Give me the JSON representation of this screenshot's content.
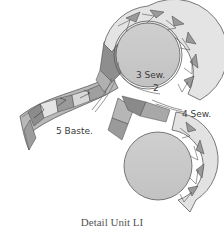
{
  "diagram": {
    "caption": "Detail Unit LI",
    "labels": {
      "step3": "3 Sew.",
      "step2": "2",
      "step4": "4 Sew.",
      "step5": "5 Baste."
    },
    "colors": {
      "circle_fill": "#c8c8c8",
      "light_piece": "#e6e6e6",
      "mid_piece": "#b4b4b4",
      "dark_piece": "#8c8c8c",
      "outline": "#5a5a5a",
      "text": "#3a3a3a"
    }
  }
}
